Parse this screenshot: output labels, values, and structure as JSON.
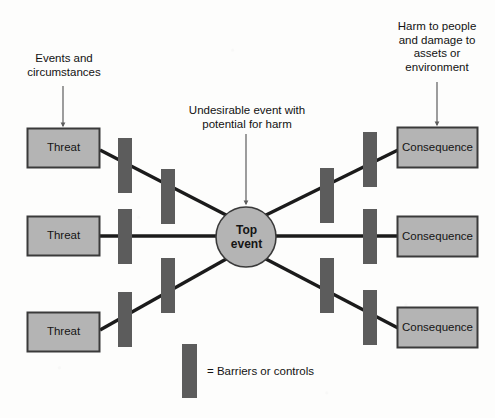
{
  "diagram": {
    "title_visible": false,
    "type": "bow-tie-risk-diagram",
    "colors": {
      "node_fill": "#b4b4b4",
      "node_stroke": "#3a3a3a",
      "barrier_fill": "#5c5c5c",
      "line_stroke": "#1b1b1b",
      "annotation_arrow": "#5d5d5d",
      "background": "#fdfdfc",
      "text": "#151515"
    },
    "annotations": [
      {
        "id": "left-annotation",
        "text": "Events and\ncircumstances",
        "arrow_target": "threat-box-1"
      },
      {
        "id": "center-annotation",
        "text": "Undesirable event with\npotential for harm",
        "arrow_target": "top-event-node"
      },
      {
        "id": "right-annotation",
        "text": "Harm to people\nand damage to\nassets or\nenvironment",
        "arrow_target": "consequence-box-1"
      }
    ],
    "threats": [
      {
        "label": "Threat"
      },
      {
        "label": "Threat"
      },
      {
        "label": "Threat"
      }
    ],
    "center_node": {
      "label_line_1": "Top",
      "label_line_2": "event"
    },
    "consequences": [
      {
        "label": "Consequence"
      },
      {
        "label": "Consequence"
      },
      {
        "label": "Consequence"
      }
    ],
    "barriers": {
      "count": 12,
      "left_count": 6,
      "right_count": 6
    },
    "legend": {
      "equals_label": "= Barriers or controls",
      "swatch_name": "barrier-swatch"
    }
  }
}
